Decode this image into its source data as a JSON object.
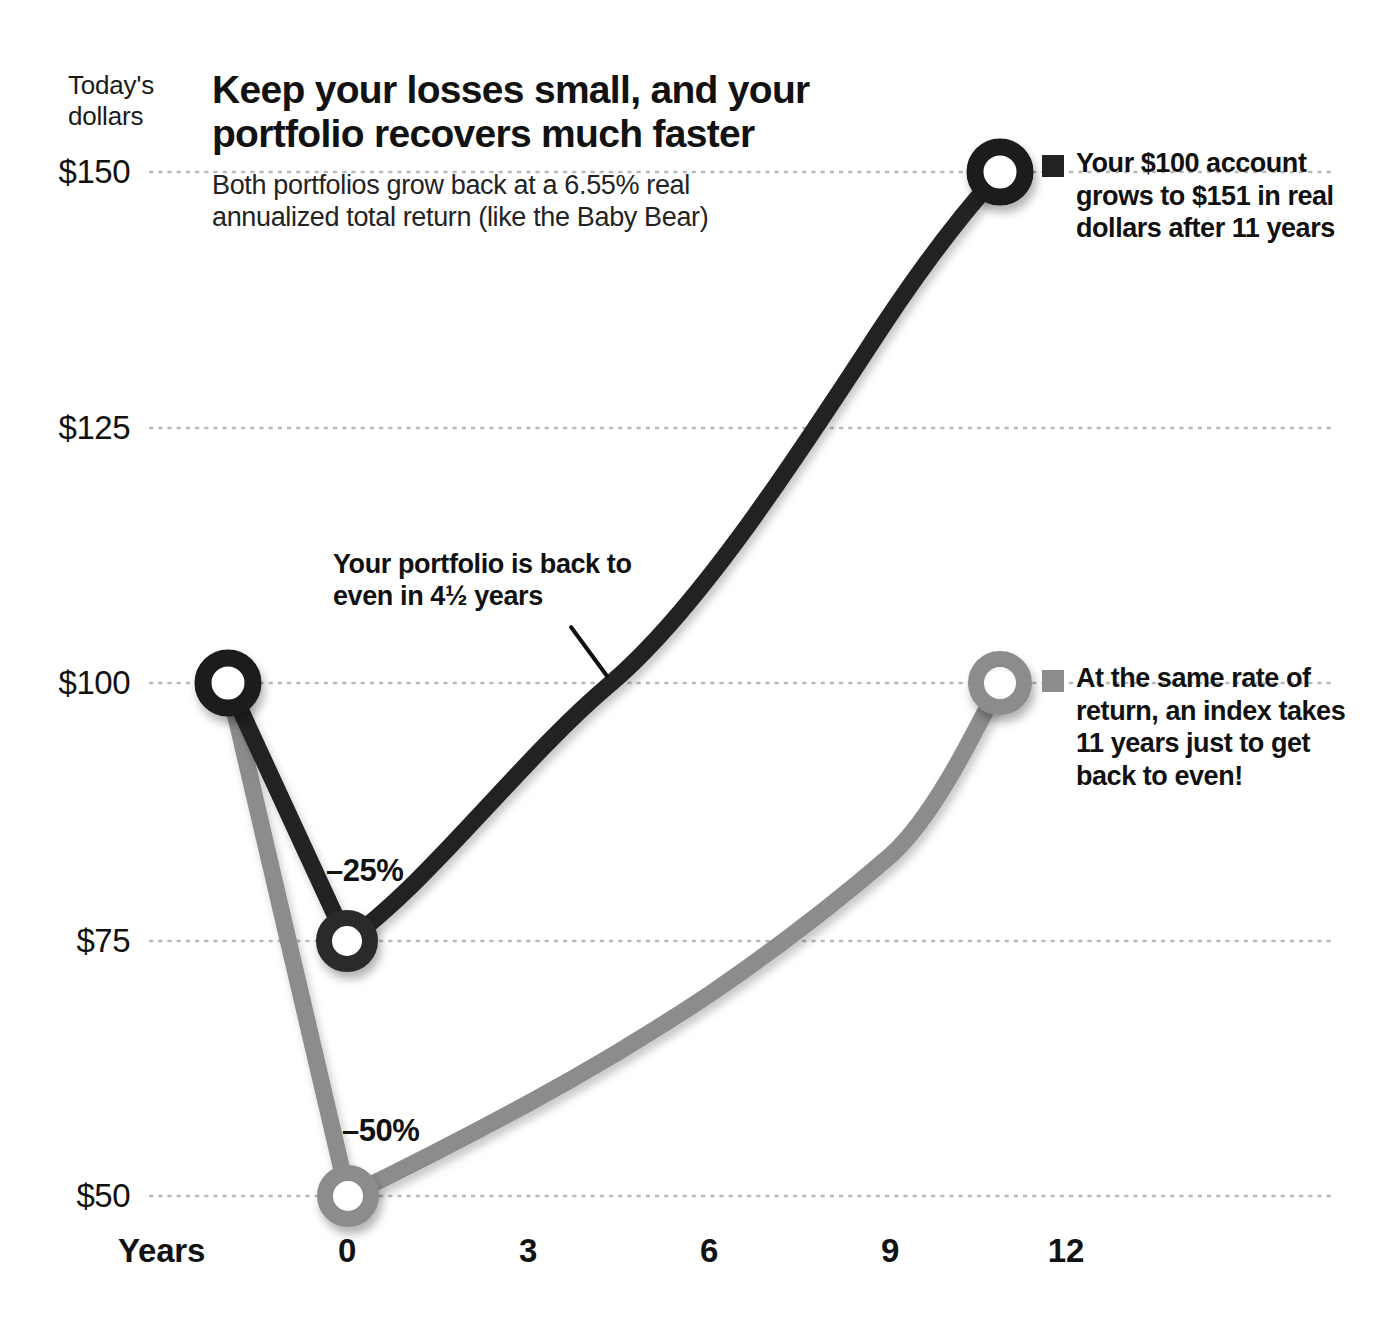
{
  "axis_corner_label": "Today's\ndollars",
  "headline": {
    "title": "Keep your losses small, and your portfolio recovers much faster",
    "subtitle": "Both portfolios grow back at a 6.55% real annualized total return (like the Baby Bear)"
  },
  "annotations": {
    "recovery_note": "Your portfolio is back to even in 4½ years",
    "drawdown_black": "–25%",
    "drawdown_gray": "–50%"
  },
  "callouts": [
    {
      "name": "your-account",
      "color": "#222222",
      "text": "Your $100 account grows to $151  in real dollars after 11 years"
    },
    {
      "name": "index",
      "color": "#8c8c8c",
      "text": "At the same rate of return, an index takes 11 years just to get back to even!"
    }
  ],
  "colors": {
    "black_series": "#222222",
    "gray_series": "#8c8c8c",
    "gridline": "#b9b9b9",
    "text": "#111111",
    "background": "#ffffff"
  },
  "chart_data": {
    "type": "line",
    "title": "Keep your losses small, and your portfolio recovers much faster",
    "subtitle": "Both portfolios grow back at a 6.55% real annualized total return (like the Baby Bear)",
    "xlabel": "Years",
    "ylabel": "Today's dollars",
    "xlim": [
      -1.4,
      12.6
    ],
    "ylim": [
      46,
      155
    ],
    "xticks": [
      0,
      3,
      6,
      9,
      12
    ],
    "xticklabels": [
      "0",
      "3",
      "6",
      "9",
      "12"
    ],
    "yticks": [
      50,
      75,
      100,
      125,
      150
    ],
    "yticklabels": [
      "$50",
      "$75",
      "$100",
      "$125",
      "$150"
    ],
    "grid": "horizontal-dotted",
    "legend_position": "right-inline-callouts",
    "annualized_return_pct": 6.55,
    "series": [
      {
        "name": "Your $100 account (–25% drawdown)",
        "color": "#222222",
        "marker": "open-circle",
        "pre_drop": {
          "x": -1.3,
          "y": 100
        },
        "x": [
          0,
          1,
          2,
          3,
          4,
          4.5,
          5,
          6,
          7,
          8,
          9,
          10,
          11
        ],
        "y": [
          75,
          79.9,
          85.1,
          90.7,
          96.6,
          99.7,
          102.9,
          109.7,
          116.8,
          124.5,
          132.6,
          141.3,
          150.5
        ],
        "endpoint_label": "$151",
        "drawdown_label": "–25%",
        "recovery_years": 4.5
      },
      {
        "name": "Index (–50% drawdown)",
        "color": "#8c8c8c",
        "marker": "open-circle",
        "pre_drop": {
          "x": -1.3,
          "y": 100
        },
        "x": [
          0,
          1,
          2,
          3,
          4,
          5,
          6,
          7,
          8,
          9,
          10,
          11
        ],
        "y": [
          50,
          53.3,
          56.8,
          60.5,
          64.4,
          68.6,
          73.1,
          77.9,
          83.0,
          88.4,
          94.2,
          100.3
        ],
        "endpoint_label": "$100",
        "drawdown_label": "–50%",
        "recovery_years": 11
      }
    ]
  }
}
